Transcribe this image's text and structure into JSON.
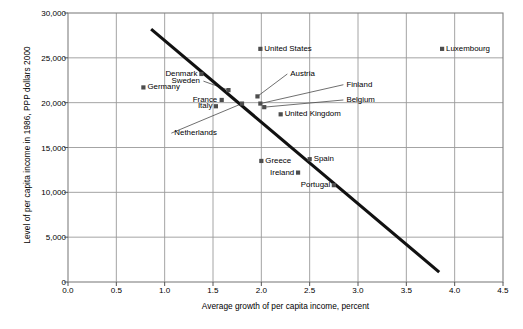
{
  "chart_data": {
    "type": "scatter",
    "title": "",
    "xlabel": "Average growth of per capita income, percent",
    "ylabel": "Level of per capita income in 1986, PPP dollars 2000",
    "xlim": [
      0.0,
      4.5
    ],
    "ylim": [
      0,
      30000
    ],
    "xticks": [
      "0.0",
      "0.5",
      "1.0",
      "1.5",
      "2.0",
      "2.5",
      "3.0",
      "3.5",
      "4.0",
      "4.5"
    ],
    "xtick_values": [
      0.0,
      0.5,
      1.0,
      1.5,
      2.0,
      2.5,
      3.0,
      3.5,
      4.0,
      4.5
    ],
    "yticks": [
      "0",
      "5,000",
      "10,000",
      "15,000",
      "20,000",
      "25,000",
      "30,000"
    ],
    "ytick_values": [
      0,
      5000,
      10000,
      15000,
      20000,
      25000,
      30000
    ],
    "grid": true,
    "legend": "none",
    "marker_color": "#4d4d4d",
    "grid_color": "#9a9a9a",
    "axis_color": "#808080",
    "trendline_color": "#111111",
    "trendline": {
      "x0": 0.86,
      "y0": 28200,
      "x1": 3.84,
      "y1": 1100,
      "label": "fitted regression line"
    },
    "points": [
      {
        "name": "Germany",
        "x": 0.78,
        "y": 21700,
        "label_pos": "right"
      },
      {
        "name": "Denmark",
        "x": 1.38,
        "y": 23200,
        "label_pos": "left"
      },
      {
        "name": "France",
        "x": 1.59,
        "y": 20300,
        "label_pos": "left"
      },
      {
        "name": "Italy",
        "x": 1.53,
        "y": 19600,
        "label_pos": "left"
      },
      {
        "name": "Sweden",
        "x": 1.66,
        "y": 21400,
        "label_pos": "callout"
      },
      {
        "name": "Netherlands",
        "x": 1.8,
        "y": 19900,
        "label_pos": "callout"
      },
      {
        "name": "Austria",
        "x": 1.96,
        "y": 20700,
        "label_pos": "callout"
      },
      {
        "name": "Finland",
        "x": 1.99,
        "y": 19900,
        "label_pos": "callout"
      },
      {
        "name": "Belgium",
        "x": 2.03,
        "y": 19500,
        "label_pos": "callout"
      },
      {
        "name": "United States",
        "x": 1.99,
        "y": 26000,
        "label_pos": "right"
      },
      {
        "name": "Luxembourg",
        "x": 3.87,
        "y": 26000,
        "label_pos": "right"
      },
      {
        "name": "United Kingdom",
        "x": 2.2,
        "y": 18700,
        "label_pos": "right"
      },
      {
        "name": "Greece",
        "x": 2.0,
        "y": 13500,
        "label_pos": "right"
      },
      {
        "name": "Spain",
        "x": 2.5,
        "y": 13700,
        "label_pos": "right"
      },
      {
        "name": "Ireland",
        "x": 2.38,
        "y": 12200,
        "label_pos": "left"
      },
      {
        "name": "Portugal",
        "x": 2.75,
        "y": 10800,
        "label_pos": "left"
      }
    ],
    "callouts": [
      {
        "name": "Sweden",
        "label_x": 1.37,
        "label_y": 22400,
        "anchor": "right"
      },
      {
        "name": "Austria",
        "label_x": 2.3,
        "label_y": 23200,
        "anchor": "left"
      },
      {
        "name": "Finland",
        "label_x": 2.88,
        "label_y": 22000,
        "anchor": "left"
      },
      {
        "name": "Belgium",
        "label_x": 2.88,
        "label_y": 20300,
        "anchor": "left"
      },
      {
        "name": "Netherlands",
        "label_x": 1.1,
        "label_y": 16600,
        "anchor": "left"
      }
    ]
  }
}
